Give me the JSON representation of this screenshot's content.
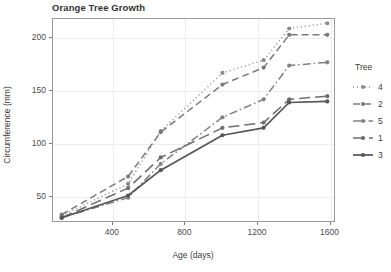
{
  "chart_data": {
    "type": "line",
    "title": "Orange Tree Growth",
    "xlabel": "Age (days)",
    "ylabel": "Circumference (mm)",
    "xlim": [
      70,
      1630
    ],
    "ylim": [
      25,
      218
    ],
    "xticks": [
      400,
      800,
      1200,
      1600
    ],
    "yticks": [
      50,
      100,
      150,
      200
    ],
    "grid": true,
    "legend_position": "right",
    "legend_title": "Tree",
    "x": [
      118,
      484,
      664,
      1004,
      1231,
      1372,
      1582
    ],
    "series": [
      {
        "name": "4",
        "linestyle": "dotted",
        "color": "#8c8c8c",
        "values": [
          32,
          62,
          112,
          167,
          179,
          209,
          214
        ]
      },
      {
        "name": "2",
        "linestyle": "dashed",
        "color": "#7a7a7a",
        "values": [
          33,
          69,
          111,
          156,
          172,
          203,
          203
        ]
      },
      {
        "name": "5",
        "linestyle": "dashdot",
        "color": "#828282",
        "values": [
          30,
          49,
          81,
          125,
          142,
          174,
          177
        ]
      },
      {
        "name": "1",
        "linestyle": "longdash",
        "color": "#6e6e6e",
        "values": [
          30,
          58,
          87,
          115,
          120,
          142,
          145
        ]
      },
      {
        "name": "3",
        "linestyle": "solid",
        "color": "#555555",
        "values": [
          30,
          51,
          75,
          108,
          115,
          139,
          140
        ]
      }
    ]
  },
  "legend": {
    "title": "Tree",
    "items": [
      {
        "label": "4"
      },
      {
        "label": "2"
      },
      {
        "label": "5"
      },
      {
        "label": "1"
      },
      {
        "label": "3"
      }
    ]
  }
}
